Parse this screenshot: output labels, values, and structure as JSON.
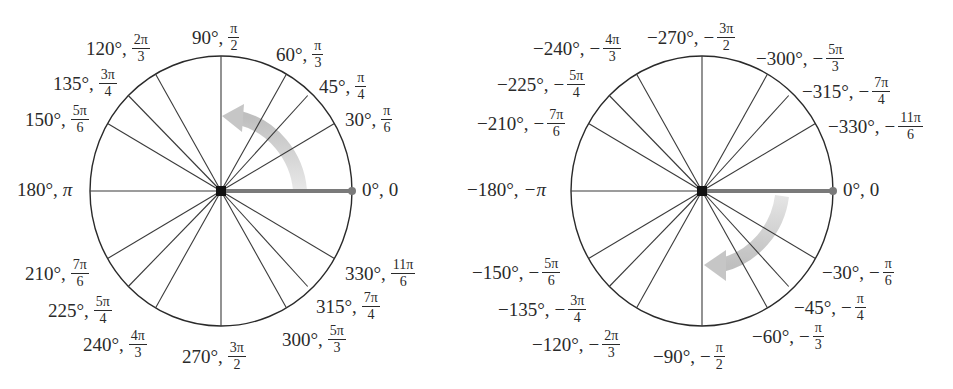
{
  "diagrams": [
    {
      "name": "positive-angles",
      "center": [
        221,
        191
      ],
      "radius": [
        131,
        135
      ],
      "direction": "counterclockwise",
      "arrow_color": "#b8b8b8",
      "initial_side_color": "#7a7a7a",
      "labels": [
        {
          "deg": "0°",
          "rad_plain": "0",
          "x": 362,
          "y": 180
        },
        {
          "deg": "30°",
          "num": "π",
          "den": "6",
          "x": 345,
          "y": 104
        },
        {
          "deg": "45°",
          "num": "π",
          "den": "4",
          "x": 319,
          "y": 71
        },
        {
          "deg": "60°",
          "num": "π",
          "den": "3",
          "x": 276,
          "y": 39
        },
        {
          "deg": "90°",
          "num": "π",
          "den": "2",
          "x": 192,
          "y": 22
        },
        {
          "deg": "120°",
          "num": "2π",
          "den": "3",
          "x": 86,
          "y": 33
        },
        {
          "deg": "135°",
          "num": "3π",
          "den": "4",
          "x": 53,
          "y": 68
        },
        {
          "deg": "150°",
          "num": "5π",
          "den": "6",
          "x": 25,
          "y": 104
        },
        {
          "deg": "180°",
          "rad_plain": "π",
          "x": 17,
          "y": 180
        },
        {
          "deg": "210°",
          "num": "7π",
          "den": "6",
          "x": 25,
          "y": 258
        },
        {
          "deg": "225°",
          "num": "5π",
          "den": "4",
          "x": 48,
          "y": 295
        },
        {
          "deg": "240°",
          "num": "4π",
          "den": "3",
          "x": 83,
          "y": 329
        },
        {
          "deg": "270°",
          "num": "3π",
          "den": "2",
          "x": 182,
          "y": 341
        },
        {
          "deg": "300°",
          "num": "5π",
          "den": "3",
          "x": 282,
          "y": 324
        },
        {
          "deg": "315°",
          "num": "7π",
          "den": "4",
          "x": 316,
          "y": 291
        },
        {
          "deg": "330°",
          "num": "11π",
          "den": "6",
          "x": 345,
          "y": 258
        }
      ]
    },
    {
      "name": "negative-angles",
      "center": [
        702,
        191
      ],
      "radius": [
        131,
        135
      ],
      "direction": "clockwise",
      "arrow_color": "#b8b8b8",
      "initial_side_color": "#7a7a7a",
      "labels": [
        {
          "deg": "0°",
          "rad_plain": "0",
          "x": 843,
          "y": 180
        },
        {
          "deg": "−30°",
          "neg": true,
          "num": "π",
          "den": "6",
          "x": 822,
          "y": 257
        },
        {
          "deg": "−45°",
          "neg": true,
          "num": "π",
          "den": "4",
          "x": 794,
          "y": 292
        },
        {
          "deg": "−60°",
          "neg": true,
          "num": "π",
          "den": "3",
          "x": 752,
          "y": 321
        },
        {
          "deg": "−90°",
          "neg": true,
          "num": "π",
          "den": "2",
          "x": 653,
          "y": 341
        },
        {
          "deg": "−120°",
          "neg": true,
          "num": "2π",
          "den": "3",
          "x": 532,
          "y": 329
        },
        {
          "deg": "−135°",
          "neg": true,
          "num": "3π",
          "den": "4",
          "x": 498,
          "y": 294
        },
        {
          "deg": "−150°",
          "neg": true,
          "num": "5π",
          "den": "6",
          "x": 472,
          "y": 257
        },
        {
          "deg": "−180°",
          "neg_plain": "−π",
          "x": 467,
          "y": 180
        },
        {
          "deg": "−210°",
          "neg": true,
          "num": "7π",
          "den": "6",
          "x": 477,
          "y": 108
        },
        {
          "deg": "−225°",
          "neg": true,
          "num": "5π",
          "den": "4",
          "x": 497,
          "y": 69
        },
        {
          "deg": "−240°",
          "neg": true,
          "num": "4π",
          "den": "3",
          "x": 533,
          "y": 33
        },
        {
          "deg": "−270°",
          "neg": true,
          "num": "3π",
          "den": "2",
          "x": 647,
          "y": 22
        },
        {
          "deg": "−300°",
          "neg": true,
          "num": "5π",
          "den": "3",
          "x": 756,
          "y": 43
        },
        {
          "deg": "−315°",
          "neg": true,
          "num": "7π",
          "den": "4",
          "x": 802,
          "y": 76
        },
        {
          "deg": "−330°",
          "neg": true,
          "num": "11π",
          "den": "6",
          "x": 828,
          "y": 111
        }
      ]
    }
  ]
}
